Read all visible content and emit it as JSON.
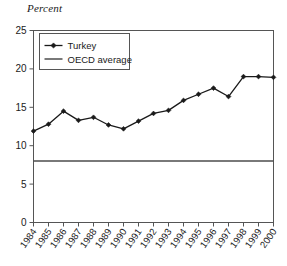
{
  "chart_data": {
    "type": "line",
    "title": "Percent",
    "ylabel": "Percent",
    "xlabel": "",
    "grid": false,
    "legend_position": "top-left-inside",
    "x": [
      "1984",
      "1985",
      "1986",
      "1987",
      "1988",
      "1989",
      "1990",
      "1991",
      "1992",
      "1993",
      "1994",
      "1995",
      "1996",
      "1997",
      "1998",
      "1999",
      "2000"
    ],
    "categories": [
      "1984",
      "1985",
      "1986",
      "1987",
      "1988",
      "1989",
      "1990",
      "1991",
      "1992",
      "1993",
      "1994",
      "1995",
      "1996",
      "1997",
      "1998",
      "1999",
      "2000"
    ],
    "ylim": [
      0,
      25
    ],
    "yticks": [
      0,
      5,
      10,
      15,
      20,
      25
    ],
    "ytick_labels": [
      "0",
      "5",
      "10",
      "15",
      "20",
      "25"
    ],
    "series": [
      {
        "name": "Turkey",
        "marker": "diamond",
        "color": "#1a1a1a",
        "values": [
          11.9,
          12.8,
          14.5,
          13.3,
          13.7,
          12.7,
          12.2,
          13.2,
          14.2,
          14.6,
          15.9,
          16.7,
          17.5,
          16.4,
          19.0,
          19.0,
          18.9
        ]
      },
      {
        "name": "OECD average",
        "marker": "none",
        "color": "#4d4d4d",
        "constant_value": 8.0,
        "values": [
          8.0,
          8.0,
          8.0,
          8.0,
          8.0,
          8.0,
          8.0,
          8.0,
          8.0,
          8.0,
          8.0,
          8.0,
          8.0,
          8.0,
          8.0,
          8.0,
          8.0
        ]
      }
    ]
  },
  "legend": {
    "items": [
      {
        "label": "Turkey"
      },
      {
        "label": "OECD average"
      }
    ]
  },
  "colors": {
    "turkey_line": "#1a1a1a",
    "oecd_line": "#4d4d4d",
    "axis": "#555555",
    "text": "#1a1a1a",
    "background": "#ffffff"
  }
}
